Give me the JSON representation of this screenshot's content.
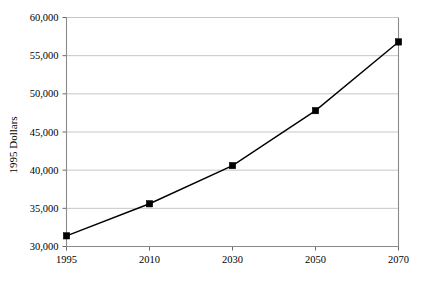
{
  "chart_data": {
    "type": "line",
    "title": "",
    "xlabel": "",
    "ylabel": "1995 Dollars",
    "categories": [
      "1995",
      "2010",
      "2030",
      "2050",
      "2070"
    ],
    "x": [
      1995,
      2010,
      2030,
      2050,
      2070
    ],
    "values": [
      31400,
      35600,
      40600,
      47800,
      56800
    ],
    "series": [
      {
        "name": "1995 Dollars",
        "values": [
          31400,
          35600,
          40600,
          47800,
          56800
        ]
      }
    ],
    "ylim": [
      30000,
      60000
    ],
    "ytick_labels": [
      "60,000",
      "55,000",
      "50,000",
      "45,000",
      "40,000",
      "35,000",
      "30,000"
    ],
    "ytick_values": [
      60000,
      55000,
      50000,
      45000,
      40000,
      35000,
      30000
    ],
    "xtick_labels": [
      "1995",
      "2010",
      "2030",
      "2050",
      "2070"
    ],
    "grid": true,
    "grid_axis": "y",
    "legend": "none",
    "marker": "filled-square",
    "line_color": "#000000",
    "grid_color": "#b8b8b8",
    "frame_color": "#8a8a8a",
    "background": "#ffffff"
  },
  "figure": {
    "caption": ""
  }
}
